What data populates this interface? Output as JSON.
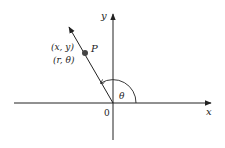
{
  "diagram": {
    "type": "polar-coordinates",
    "axes": {
      "x_label": "x",
      "y_label": "y",
      "origin_label": "0"
    },
    "point": {
      "name": "P",
      "cartesian_label": "(x, y)",
      "polar_label": "(r, θ)"
    },
    "angle_label": "θ",
    "colors": {
      "ink": "#222222",
      "point": "#444444",
      "background": "#ffffff"
    }
  }
}
